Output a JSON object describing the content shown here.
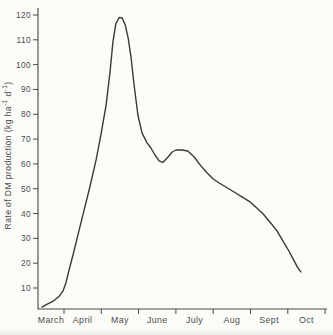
{
  "figure": {
    "background": "#fbfbf8",
    "line_color": "#3a3a3a",
    "axis_color": "#4a4a4a",
    "text_color": "#4c4c4c",
    "ylabel_parts": {
      "main": "Rate of DM production (kg ha",
      "sup1": "-1",
      "mid": " d",
      "sup2": "-1",
      "end": ")"
    }
  },
  "chart_data": {
    "type": "line",
    "title": "",
    "xlabel": "",
    "ylabel": "Rate of DM production (kg ha⁻¹ d⁻¹)",
    "x_categories": [
      "March",
      "April",
      "May",
      "June",
      "July",
      "Aug",
      "Sept",
      "Oct"
    ],
    "y_ticks": [
      10,
      20,
      30,
      40,
      50,
      60,
      70,
      80,
      90,
      100,
      110,
      120
    ],
    "ylim": [
      0,
      123
    ],
    "grid": false,
    "legend": "none",
    "key_features": {
      "start_value_mid_march": 2.3,
      "peak_value": 119,
      "peak_time": "mid-May",
      "local_min_value": 60,
      "local_min_time": "late June",
      "secondary_max_value": 66,
      "secondary_max_time": "early July",
      "end_value": 17,
      "end_time": "early October"
    },
    "points_note": "m = months after centre of March column; month-boundary ticks fall at m = 0.5 ... 7.5; v = kg ha-1 d-1",
    "points": [
      {
        "m": -0.09,
        "v": 2.3
      },
      {
        "m": 0.04,
        "v": 3.4
      },
      {
        "m": 0.21,
        "v": 4.7
      },
      {
        "m": 0.37,
        "v": 6.7
      },
      {
        "m": 0.47,
        "v": 8.7
      },
      {
        "m": 0.55,
        "v": 12.0
      },
      {
        "m": 0.63,
        "v": 16.9
      },
      {
        "m": 0.74,
        "v": 23.3
      },
      {
        "m": 0.88,
        "v": 31.8
      },
      {
        "m": 1.04,
        "v": 41.4
      },
      {
        "m": 1.2,
        "v": 51.1
      },
      {
        "m": 1.36,
        "v": 61.6
      },
      {
        "m": 1.49,
        "v": 71.7
      },
      {
        "m": 1.63,
        "v": 83.7
      },
      {
        "m": 1.73,
        "v": 96.6
      },
      {
        "m": 1.81,
        "v": 109.1
      },
      {
        "m": 1.89,
        "v": 116.4
      },
      {
        "m": 1.98,
        "v": 119.0
      },
      {
        "m": 2.06,
        "v": 118.8
      },
      {
        "m": 2.14,
        "v": 116.0
      },
      {
        "m": 2.22,
        "v": 110.7
      },
      {
        "m": 2.3,
        "v": 102.7
      },
      {
        "m": 2.38,
        "v": 91.8
      },
      {
        "m": 2.48,
        "v": 79.7
      },
      {
        "m": 2.59,
        "v": 72.5
      },
      {
        "m": 2.73,
        "v": 68.4
      },
      {
        "m": 2.83,
        "v": 66.4
      },
      {
        "m": 2.94,
        "v": 63.6
      },
      {
        "m": 3.05,
        "v": 61.2
      },
      {
        "m": 3.15,
        "v": 60.6
      },
      {
        "m": 3.29,
        "v": 62.8
      },
      {
        "m": 3.4,
        "v": 64.8
      },
      {
        "m": 3.5,
        "v": 65.6
      },
      {
        "m": 3.66,
        "v": 65.6
      },
      {
        "m": 3.82,
        "v": 65.2
      },
      {
        "m": 3.99,
        "v": 62.8
      },
      {
        "m": 4.15,
        "v": 59.6
      },
      {
        "m": 4.33,
        "v": 56.4
      },
      {
        "m": 4.5,
        "v": 53.9
      },
      {
        "m": 4.66,
        "v": 52.3
      },
      {
        "m": 4.84,
        "v": 50.7
      },
      {
        "m": 5.06,
        "v": 48.7
      },
      {
        "m": 5.27,
        "v": 46.7
      },
      {
        "m": 5.49,
        "v": 44.7
      },
      {
        "m": 5.67,
        "v": 42.2
      },
      {
        "m": 5.84,
        "v": 39.8
      },
      {
        "m": 6.02,
        "v": 36.6
      },
      {
        "m": 6.21,
        "v": 33.0
      },
      {
        "m": 6.37,
        "v": 28.9
      },
      {
        "m": 6.53,
        "v": 24.9
      },
      {
        "m": 6.67,
        "v": 20.9
      },
      {
        "m": 6.77,
        "v": 18.1
      },
      {
        "m": 6.85,
        "v": 16.5
      }
    ]
  }
}
